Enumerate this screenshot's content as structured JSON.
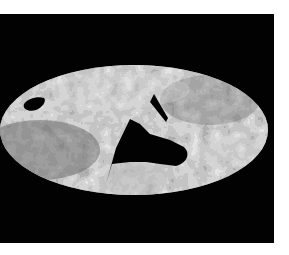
{
  "figure": {
    "background_color": "#020202",
    "page_color": "#ffffff",
    "map": {
      "projection": "elliptical",
      "palette": [
        "#4a4a4a",
        "#6e6e6e",
        "#8c8c8c",
        "#a8a8a8",
        "#c8c8c8",
        "#e6e6e6"
      ],
      "masked_regions": [
        "left-oval-hole",
        "central-wedge",
        "upper-slit"
      ]
    }
  }
}
